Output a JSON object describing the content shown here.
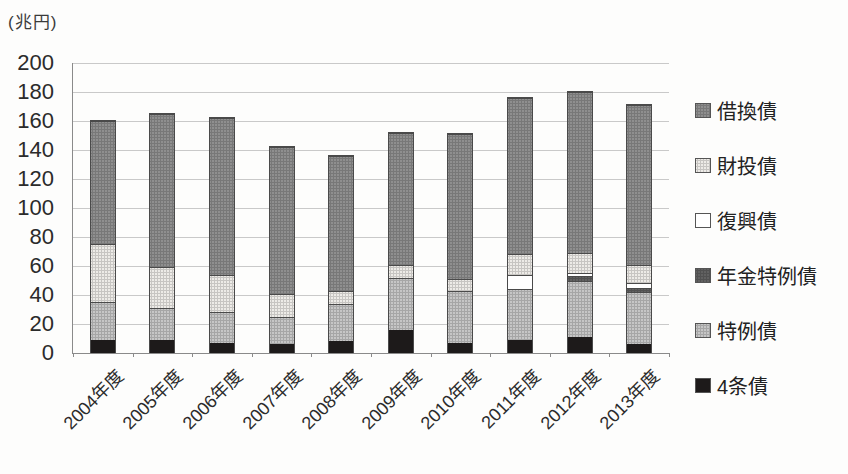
{
  "chart_data": {
    "type": "bar",
    "stacked": true,
    "unit_label": "(兆円)",
    "categories": [
      "2004年度",
      "2005年度",
      "2006年度",
      "2007年度",
      "2008年度",
      "2009年度",
      "2010年度",
      "2011年度",
      "2012年度",
      "2013年度"
    ],
    "series": [
      {
        "name": "4条債",
        "color": "#1d1a1a",
        "texture": false,
        "values": [
          9,
          9,
          7,
          6,
          8,
          16,
          7,
          9,
          11,
          6
        ]
      },
      {
        "name": "特例債",
        "color": "#c6c6c6",
        "texture": true,
        "values": [
          26,
          22,
          21,
          19,
          26,
          36,
          36,
          35,
          39,
          36
        ]
      },
      {
        "name": "年金特例債",
        "color": "#616161",
        "texture": true,
        "values": [
          0,
          0,
          0,
          0,
          0,
          0,
          0,
          0,
          3,
          3
        ]
      },
      {
        "name": "復興債",
        "color": "#ffffff",
        "texture": false,
        "values": [
          0,
          0,
          0,
          0,
          0,
          0,
          0,
          10,
          2,
          3
        ]
      },
      {
        "name": "財投債",
        "color": "#edebe7",
        "texture": true,
        "values": [
          40,
          28,
          26,
          16,
          9,
          9,
          8,
          14,
          14,
          13
        ]
      },
      {
        "name": "借換債",
        "color": "#8f8f8f",
        "texture": true,
        "values": [
          85,
          106,
          108,
          101,
          93,
          91,
          100,
          108,
          111,
          110
        ]
      }
    ],
    "totals": [
      160,
      165,
      162,
      142,
      136,
      152,
      151,
      176,
      180,
      171
    ],
    "yticks": [
      0,
      20,
      40,
      60,
      80,
      100,
      120,
      140,
      160,
      180,
      200
    ],
    "ylim": [
      0,
      200
    ],
    "grid": true,
    "legend": {
      "position": "right",
      "order": [
        "借換債",
        "財投債",
        "復興債",
        "年金特例債",
        "特例債",
        "4条債"
      ]
    }
  }
}
